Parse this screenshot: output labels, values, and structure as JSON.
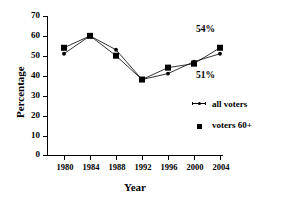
{
  "chart_data": {
    "type": "line",
    "title": "",
    "xlabel": "Year",
    "ylabel": "Percentage",
    "categories": [
      1980,
      1984,
      1988,
      1992,
      1996,
      2000,
      2004
    ],
    "xtick_labels": [
      "1980",
      "1984",
      "1988",
      "1992",
      "1996",
      "2000",
      "2004"
    ],
    "ytick_labels": [
      "0",
      "10",
      "20",
      "30",
      "40",
      "50",
      "60",
      "70"
    ],
    "yticks": [
      0,
      10,
      20,
      30,
      40,
      50,
      60,
      70
    ],
    "ylim": [
      0,
      70
    ],
    "xlim": [
      1978,
      2006
    ],
    "grid": false,
    "legend_position": "right",
    "series": [
      {
        "name": "all voters",
        "marker": "dot",
        "values": [
          51,
          60,
          53,
          38,
          41,
          47,
          51
        ]
      },
      {
        "name": "voters 60+",
        "marker": "square",
        "values": [
          54,
          60,
          50,
          38,
          44,
          46,
          54
        ]
      }
    ],
    "annotations": [
      {
        "text": "54%",
        "series": "voters 60+",
        "x": 2004,
        "y": 54
      },
      {
        "text": "51%",
        "series": "all voters",
        "x": 2004,
        "y": 51
      }
    ],
    "colors": {
      "line": "#000000",
      "marker": "#000000",
      "background": "#ffffff"
    }
  }
}
